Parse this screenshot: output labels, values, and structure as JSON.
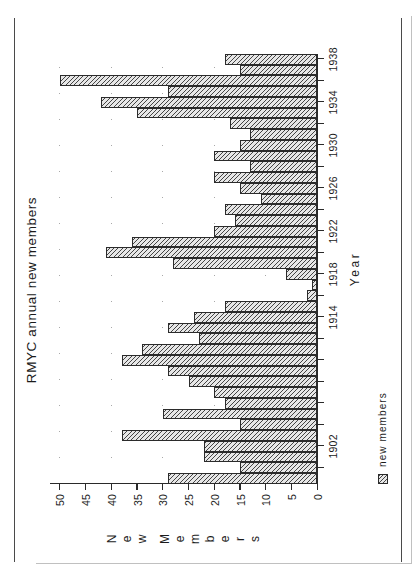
{
  "figure": {
    "title": "RMYC annual  new  members",
    "source_note": "Source:  RMYC  'Candidates  for  Election'."
  },
  "legend": {
    "swatch_name": "hatched-swatch",
    "label": "new  members"
  },
  "axes": {
    "x_title": "Year",
    "y_title_letters": [
      "N",
      "e",
      "w",
      "",
      "M",
      "e",
      "m",
      "b",
      "e",
      "r",
      "s"
    ],
    "y_ticks": [
      0,
      5,
      10,
      15,
      20,
      25,
      30,
      35,
      40,
      45,
      50
    ],
    "y_tick_labels": [
      "0",
      "5",
      "10",
      "15",
      "20",
      "25",
      "30",
      "35",
      "40",
      "45",
      "50"
    ],
    "x_tick_years": [
      1900,
      1902,
      1904,
      1906,
      1908,
      1910,
      1912,
      1914,
      1916,
      1918,
      1920,
      1922,
      1924,
      1926,
      1928,
      1930,
      1932,
      1934,
      1936,
      1938
    ],
    "x_tick_labels_shown": {
      "1902": "1902",
      "1914": "1914",
      "1918": "1918",
      "1922": "1922",
      "1926": "1926",
      "1930": "1930",
      "1934": "1934",
      "1938": "1938"
    }
  },
  "chart_data": {
    "type": "bar",
    "title": "RMYC annual  new  members",
    "xlabel": "Year",
    "ylabel": "New Members",
    "ylim": [
      0,
      52
    ],
    "grid": true,
    "legend_position": "below-left",
    "series_name": "new members",
    "categories": [
      1899,
      1900,
      1901,
      1902,
      1903,
      1904,
      1905,
      1906,
      1907,
      1908,
      1909,
      1910,
      1911,
      1912,
      1913,
      1914,
      1915,
      1916,
      1917,
      1918,
      1919,
      1920,
      1921,
      1922,
      1923,
      1924,
      1925,
      1926,
      1927,
      1928,
      1929,
      1930,
      1931,
      1932,
      1933,
      1934,
      1935,
      1936,
      1937,
      1938
    ],
    "values": [
      29,
      15,
      22,
      22,
      38,
      15,
      30,
      18,
      20,
      25,
      29,
      38,
      34,
      23,
      29,
      24,
      18,
      2,
      1,
      6,
      28,
      41,
      36,
      20,
      16,
      18,
      11,
      15,
      20,
      13,
      20,
      15,
      13,
      17,
      35,
      42,
      29,
      50,
      15,
      18
    ]
  }
}
